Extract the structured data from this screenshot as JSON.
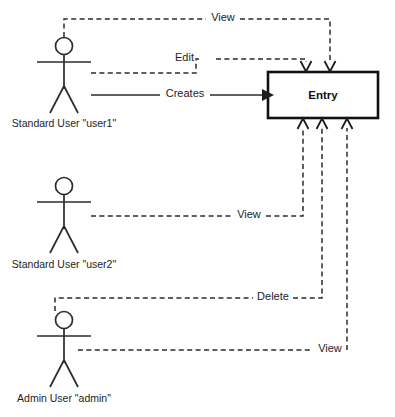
{
  "diagram": {
    "background_color": "#ffffff",
    "line_color": "#2b2b2b",
    "entity": {
      "label": "Entry",
      "x": 268,
      "y": 72,
      "width": 110,
      "height": 46
    },
    "actors": [
      {
        "id": "user1",
        "label": "Standard User \"user1\"",
        "head_x": 64,
        "head_y": 46
      },
      {
        "id": "user2",
        "label": "Standard User \"user2\"",
        "head_x": 64,
        "head_y": 186
      },
      {
        "id": "admin",
        "label": "Admin User \"admin\"",
        "head_x": 64,
        "head_y": 320
      }
    ],
    "relationships": [
      {
        "from": "user1",
        "to": "Entry",
        "label": "View",
        "style": "dashed",
        "arrow": "open",
        "enters": "top"
      },
      {
        "from": "user1",
        "to": "Entry",
        "label": "Edit",
        "style": "dashed",
        "arrow": "open",
        "enters": "top"
      },
      {
        "from": "user1",
        "to": "Entry",
        "label": "Creates",
        "style": "solid",
        "arrow": "filled",
        "enters": "left"
      },
      {
        "from": "user2",
        "to": "Entry",
        "label": "View",
        "style": "dashed",
        "arrow": "open",
        "enters": "bottom"
      },
      {
        "from": "admin",
        "to": "Entry",
        "label": "Delete",
        "style": "dashed",
        "arrow": "open",
        "enters": "bottom"
      },
      {
        "from": "admin",
        "to": "Entry",
        "label": "View",
        "style": "dashed",
        "arrow": "open",
        "enters": "bottom"
      }
    ],
    "labels": {
      "view_top": "View",
      "edit": "Edit",
      "creates": "Creates",
      "view_user2": "View",
      "delete": "Delete",
      "view_admin": "View"
    }
  }
}
